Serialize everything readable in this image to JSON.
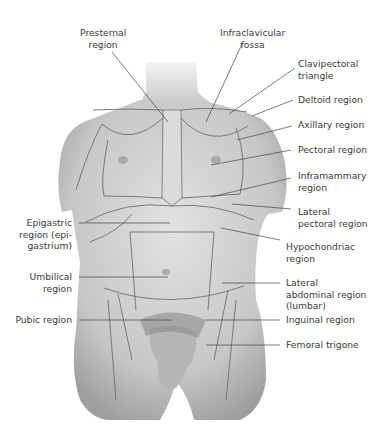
{
  "figure": {
    "colors": {
      "skin": "#d4d4d4",
      "skin_shadow": "#9a9a9a",
      "region_lines": "#6e6e6e",
      "leader_lines": "#444444",
      "text": "#3a3a3a"
    }
  },
  "labels": {
    "presternal": "Presternal\nregion",
    "infraclavicular": "Infraclavicular\nfossa",
    "clavipectoral": "Clavipectoral\ntriangle",
    "deltoid": "Deltoid region",
    "axillary": "Axillary region",
    "pectoral": "Pectoral region",
    "inframammary": "Inframammary\nregion",
    "lateral_pectoral": "Lateral\npectoral region",
    "hypochondriac": "Hypochondriac\nregion",
    "epigastric": "Epigastric\nregion (epi-\ngastrium)",
    "umbilical": "Umbilical\nregion",
    "lateral_abdominal": "Lateral\nabdominal region\n(lumbar)",
    "pubic": "Pubic region",
    "inguinal": "Inguinal region",
    "femoral": "Femoral trigone"
  }
}
